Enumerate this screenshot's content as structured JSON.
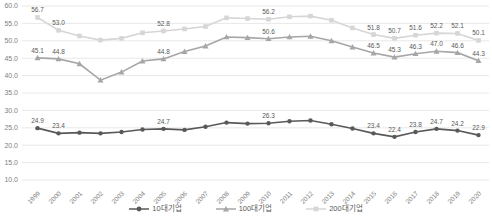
{
  "chart_data": {
    "type": "line",
    "title": "",
    "xlabel": "",
    "ylabel": "",
    "x": [
      "1999",
      "2000",
      "2001",
      "2002",
      "2003",
      "2004",
      "2005",
      "2006",
      "2007",
      "2008",
      "2009",
      "2010",
      "2011",
      "2012",
      "2013",
      "2014",
      "2015",
      "2016",
      "2017",
      "2018",
      "2019",
      "2020"
    ],
    "ylim": [
      10,
      60
    ],
    "ytick_step": 5,
    "ytick_labels": [
      "60.0",
      "55.0",
      "50.0",
      "45.0",
      "40.0",
      "35.0",
      "30.0",
      "25.0",
      "20.0",
      "15.0",
      "10.0"
    ],
    "grid": "horizontal",
    "legend_position": "bottom-center",
    "series": [
      {
        "id": "top-10",
        "name": "10대기업",
        "color": "#595959",
        "marker": "circle",
        "values": [
          24.9,
          23.4,
          23.6,
          23.4,
          23.8,
          24.5,
          24.7,
          24.4,
          25.3,
          26.5,
          26.2,
          26.3,
          26.9,
          27.1,
          26.0,
          24.8,
          23.4,
          22.4,
          23.8,
          24.7,
          24.2,
          22.9
        ],
        "data_labels": [
          "24.9",
          "23.4",
          null,
          null,
          null,
          null,
          "24.7",
          null,
          null,
          null,
          null,
          "26.3",
          null,
          null,
          null,
          null,
          "23.4",
          "22.4",
          "23.8",
          "24.7",
          "24.2",
          "22.9"
        ]
      },
      {
        "id": "top-100",
        "name": "100대기업",
        "color": "#a6a6a6",
        "marker": "triangle",
        "values": [
          45.1,
          44.8,
          43.4,
          38.7,
          41.0,
          44.2,
          44.8,
          46.9,
          48.5,
          51.1,
          50.9,
          50.6,
          51.1,
          51.3,
          50.0,
          48.2,
          46.5,
          45.3,
          46.3,
          47.0,
          46.6,
          44.3
        ],
        "data_labels": [
          "45.1",
          "44.8",
          null,
          null,
          null,
          null,
          "44.8",
          null,
          null,
          null,
          null,
          "50.6",
          null,
          null,
          null,
          null,
          "46.5",
          "45.3",
          "46.3",
          "47.0",
          "46.6",
          "44.3"
        ]
      },
      {
        "id": "top-200",
        "name": "200대기업",
        "color": "#d6d6d6",
        "marker": "square",
        "values": [
          56.7,
          53.0,
          51.4,
          50.2,
          50.7,
          52.3,
          52.8,
          53.4,
          54.1,
          56.6,
          56.4,
          56.2,
          56.9,
          57.1,
          55.9,
          53.7,
          51.8,
          50.7,
          51.6,
          52.2,
          52.1,
          50.1
        ],
        "data_labels": [
          "56.7",
          "53.0",
          null,
          null,
          null,
          null,
          "52.8",
          null,
          null,
          null,
          null,
          "56.2",
          null,
          null,
          null,
          null,
          "51.8",
          "50.7",
          "51.6",
          "52.2",
          "52.1",
          "50.1"
        ]
      }
    ],
    "style": {
      "gridline_color": "#e8e8e8",
      "axis_text_color": "#7f7f7f",
      "data_label_color": "#595959",
      "background": "#ffffff"
    }
  }
}
